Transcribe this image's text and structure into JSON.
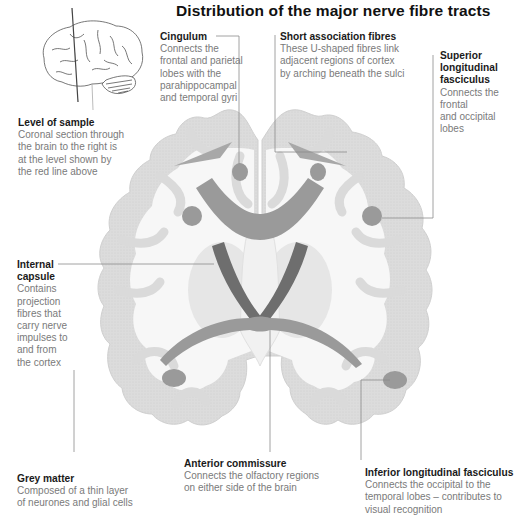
{
  "title": "Distribution of the major nerve fibre tracts",
  "colors": {
    "grey_matter": "#d9d9d9",
    "white_matter": "#f7f7f7",
    "fibre_tract": "#9a9a9a",
    "internal_capsule": "#6e6e6e",
    "leader_line": "#8a8a8a",
    "sample_line": "#444444"
  },
  "labels": {
    "level_of_sample": {
      "heading": "Level of sample",
      "body": "Coronal section through\nthe brain to the right is\nat the level shown by\nthe red line above"
    },
    "cingulum": {
      "heading": "Cingulum",
      "body": "Connects the\nfrontal and parietal\nlobes with the\nparahippocampal\nand temporal gyri"
    },
    "short_association_fibres": {
      "heading": "Short association fibres",
      "body": "These U-shaped fibres link\nadjacent regions of cortex\nby arching beneath the sulci"
    },
    "superior_longitudinal_fasciculus": {
      "heading": "Superior\nlongitudinal\nfasciculus",
      "body": "Connects the frontal\nand occipital lobes"
    },
    "internal_capsule": {
      "heading": "Internal\ncapsule",
      "body": "Contains\nprojection\nfibres that\ncarry nerve\nimpulses to\nand from\nthe cortex"
    },
    "grey_matter": {
      "heading": "Grey matter",
      "body": "Composed of a thin layer\nof neurones and glial cells"
    },
    "anterior_commissure": {
      "heading": "Anterior commissure",
      "body": "Connects the olfactory regions\non either side of the brain"
    },
    "inferior_longitudinal_fasciculus": {
      "heading": "Inferior longitudinal fasciculus",
      "body": "Connects the occipital to the\ntemporal lobes – contributes to\nvisual recognition"
    }
  }
}
